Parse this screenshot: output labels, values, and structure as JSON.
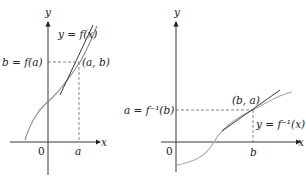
{
  "left_graph": {
    "axis_x_label": "x",
    "axis_y_label": "y",
    "origin_label": "0",
    "x_tick_label": "a",
    "y_tick_label": "b = f(a)",
    "point_label": "(a, b)",
    "curve_label": "y = f(x)"
  },
  "right_graph": {
    "axis_x_label": "x",
    "axis_y_label": "y",
    "origin_label": "0",
    "x_tick_label": "b",
    "y_tick_label": "a = f⁻¹(b)",
    "point_label": "(b, a)",
    "curve_label": "y = f⁻¹(x)"
  },
  "colors": {
    "axis": "#222222",
    "curve": "#9a9a9a",
    "tangent": "#222222",
    "dashed": "#555555"
  }
}
